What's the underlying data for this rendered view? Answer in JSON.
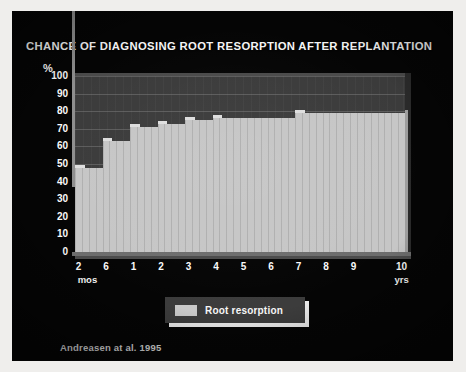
{
  "slide": {
    "title": "CHANCE OF DIAGNOSING ROOT RESORPTION AFTER REPLANTATION",
    "citation": "Andreasen at al. 1995",
    "background_color": "#050505",
    "title_color": "#f4f4f4"
  },
  "legend": {
    "label": "Root resorption",
    "swatch_color": "#c9c9c9",
    "box_color": "#3c3c3c",
    "position": "bottom-center"
  },
  "axes": {
    "y_unit": "%",
    "y_ticks": [
      "100",
      "90",
      "80",
      "70",
      "60",
      "50",
      "40",
      "30",
      "20",
      "10",
      "0"
    ],
    "x_tick_labels": [
      "2",
      "6",
      "1",
      "2",
      "3",
      "4",
      "5",
      "6",
      "7",
      "8",
      "9",
      "10"
    ],
    "x_unit_left": "mos",
    "x_unit_right": "yrs"
  },
  "chart_data": {
    "type": "bar",
    "title": "CHANCE OF DIAGNOSING ROOT RESORPTION AFTER REPLANTATION",
    "xlabel": "",
    "ylabel": "%",
    "ylim": [
      0,
      100
    ],
    "grid": true,
    "legend_position": "bottom-center",
    "series": [
      {
        "name": "Root resorption",
        "color": "#c6c6c6",
        "values": [
          48,
          48,
          48,
          48,
          63,
          63,
          63,
          63,
          71,
          71,
          71,
          71,
          73,
          73,
          73,
          73,
          75,
          75,
          75,
          75,
          76,
          76,
          76,
          76,
          76,
          76,
          76,
          76,
          76,
          76,
          76,
          76,
          79,
          79,
          79,
          79,
          79,
          79,
          79,
          79,
          79,
          79,
          79,
          79,
          79,
          79,
          79,
          79
        ]
      }
    ],
    "x_tick_positions": [
      0,
      4,
      8,
      12,
      16,
      20,
      24,
      28,
      32,
      36,
      40,
      47
    ],
    "x_tick_labels": [
      "2",
      "6",
      "1",
      "2",
      "3",
      "4",
      "5",
      "6",
      "7",
      "8",
      "9",
      "10"
    ],
    "annotations": [
      "mos",
      "yrs",
      "Andreasen at al. 1995"
    ]
  }
}
